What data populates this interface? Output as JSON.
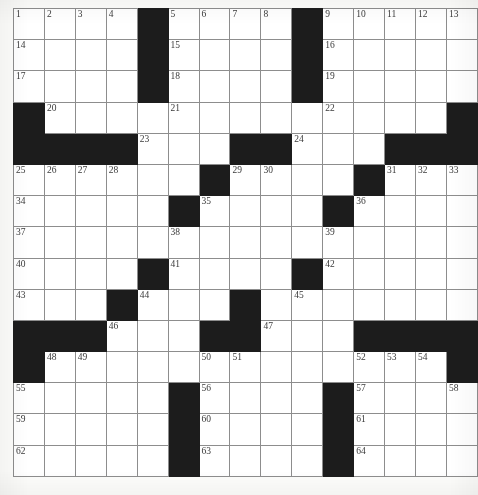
{
  "puzzle": {
    "type": "crossword-grid",
    "rows": 15,
    "columns": 15,
    "cell_size_px": 30.2,
    "colors": {
      "block": "#1c1c1c",
      "open": "#ffffff",
      "grid_line": "#8d8d8d",
      "border": "#2b2b2b",
      "number_text": "#3a3a3a"
    },
    "legend": {
      "block_symbol": "#",
      "open_symbol": "."
    },
    "grid": [
      "....#....#.....",
      "....#....#.....",
      "....#....#.....",
      "#...............",
      "####...##......",
      "......#..##..##",
      "....#.#......##",
      ".....#...#.....",
      "....#....#.....",
      "...#...#.......",
      "###...##.......",
      "#..........###.",
      "#....#....#....",
      ".....#....#....",
      ".....#....#...."
    ],
    "grid_exact": [
      [
        ".",
        ".",
        ".",
        ".",
        "#",
        ".",
        ".",
        ".",
        ".",
        "#",
        ".",
        ".",
        ".",
        ".",
        "."
      ],
      [
        ".",
        ".",
        ".",
        ".",
        "#",
        ".",
        ".",
        ".",
        ".",
        "#",
        ".",
        ".",
        ".",
        ".",
        "."
      ],
      [
        ".",
        ".",
        ".",
        ".",
        "#",
        ".",
        ".",
        ".",
        ".",
        "#",
        ".",
        ".",
        ".",
        ".",
        "."
      ],
      [
        "#",
        ".",
        ".",
        ".",
        ".",
        ".",
        ".",
        ".",
        ".",
        ".",
        ".",
        ".",
        ".",
        ".",
        "#"
      ],
      [
        "#",
        "#",
        "#",
        "#",
        ".",
        ".",
        ".",
        "#",
        "#",
        ".",
        ".",
        ".",
        "#",
        "#",
        "#"
      ],
      [
        ".",
        ".",
        ".",
        ".",
        ".",
        ".",
        "#",
        ".",
        ".",
        ".",
        ".",
        "#",
        ".",
        ".",
        "."
      ],
      [
        ".",
        ".",
        ".",
        ".",
        ".",
        "#",
        ".",
        ".",
        ".",
        ".",
        "#",
        ".",
        ".",
        ".",
        "."
      ],
      [
        ".",
        ".",
        ".",
        ".",
        ".",
        ".",
        ".",
        ".",
        ".",
        ".",
        ".",
        ".",
        ".",
        ".",
        "."
      ],
      [
        ".",
        ".",
        ".",
        ".",
        "#",
        ".",
        ".",
        ".",
        ".",
        "#",
        ".",
        ".",
        ".",
        ".",
        "."
      ],
      [
        ".",
        ".",
        ".",
        "#",
        ".",
        ".",
        ".",
        "#",
        ".",
        ".",
        ".",
        ".",
        ".",
        ".",
        "."
      ],
      [
        "#",
        "#",
        "#",
        ".",
        ".",
        ".",
        "#",
        "#",
        ".",
        ".",
        ".",
        "#",
        "#",
        "#",
        "#"
      ],
      [
        "#",
        ".",
        ".",
        ".",
        ".",
        ".",
        ".",
        ".",
        ".",
        ".",
        ".",
        ".",
        ".",
        ".",
        "#"
      ],
      [
        ".",
        ".",
        ".",
        ".",
        ".",
        "#",
        ".",
        ".",
        ".",
        ".",
        "#",
        ".",
        ".",
        ".",
        "."
      ],
      [
        ".",
        ".",
        ".",
        ".",
        ".",
        "#",
        ".",
        ".",
        ".",
        ".",
        "#",
        ".",
        ".",
        ".",
        "."
      ],
      [
        ".",
        ".",
        ".",
        ".",
        ".",
        "#",
        ".",
        ".",
        ".",
        ".",
        "#",
        ".",
        ".",
        ".",
        "."
      ]
    ],
    "numbers": [
      {
        "n": 1,
        "row": 1,
        "col": 1
      },
      {
        "n": 2,
        "row": 1,
        "col": 2
      },
      {
        "n": 3,
        "row": 1,
        "col": 3
      },
      {
        "n": 4,
        "row": 1,
        "col": 4
      },
      {
        "n": 5,
        "row": 1,
        "col": 6
      },
      {
        "n": 6,
        "row": 1,
        "col": 7
      },
      {
        "n": 7,
        "row": 1,
        "col": 8
      },
      {
        "n": 8,
        "row": 1,
        "col": 9
      },
      {
        "n": 9,
        "row": 1,
        "col": 11
      },
      {
        "n": 10,
        "row": 1,
        "col": 12
      },
      {
        "n": 11,
        "row": 1,
        "col": 13
      },
      {
        "n": 12,
        "row": 1,
        "col": 14
      },
      {
        "n": 13,
        "row": 1,
        "col": 15
      },
      {
        "n": 14,
        "row": 2,
        "col": 1
      },
      {
        "n": 15,
        "row": 2,
        "col": 6
      },
      {
        "n": 16,
        "row": 2,
        "col": 11
      },
      {
        "n": 17,
        "row": 3,
        "col": 1
      },
      {
        "n": 18,
        "row": 3,
        "col": 6
      },
      {
        "n": 19,
        "row": 3,
        "col": 11
      },
      {
        "n": 20,
        "row": 4,
        "col": 2
      },
      {
        "n": 21,
        "row": 4,
        "col": 6
      },
      {
        "n": 22,
        "row": 4,
        "col": 11
      },
      {
        "n": 23,
        "row": 5,
        "col": 5
      },
      {
        "n": 24,
        "row": 5,
        "col": 10
      },
      {
        "n": 25,
        "row": 6,
        "col": 1
      },
      {
        "n": 26,
        "row": 6,
        "col": 2
      },
      {
        "n": 27,
        "row": 6,
        "col": 3
      },
      {
        "n": 28,
        "row": 6,
        "col": 4
      },
      {
        "n": 29,
        "row": 6,
        "col": 8
      },
      {
        "n": 30,
        "row": 6,
        "col": 9
      },
      {
        "n": 31,
        "row": 6,
        "col": 13
      },
      {
        "n": 32,
        "row": 6,
        "col": 14
      },
      {
        "n": 33,
        "row": 6,
        "col": 15
      },
      {
        "n": 34,
        "row": 7,
        "col": 1
      },
      {
        "n": 35,
        "row": 7,
        "col": 7
      },
      {
        "n": 36,
        "row": 7,
        "col": 12
      },
      {
        "n": 37,
        "row": 8,
        "col": 1
      },
      {
        "n": 38,
        "row": 8,
        "col": 6
      },
      {
        "n": 39,
        "row": 8,
        "col": 11
      },
      {
        "n": 40,
        "row": 9,
        "col": 1
      },
      {
        "n": 41,
        "row": 9,
        "col": 6
      },
      {
        "n": 42,
        "row": 9,
        "col": 11
      },
      {
        "n": 43,
        "row": 10,
        "col": 1
      },
      {
        "n": 44,
        "row": 10,
        "col": 5
      },
      {
        "n": 45,
        "row": 10,
        "col": 10
      },
      {
        "n": 46,
        "row": 11,
        "col": 4
      },
      {
        "n": 47,
        "row": 11,
        "col": 9
      },
      {
        "n": 48,
        "row": 12,
        "col": 2
      },
      {
        "n": 49,
        "row": 12,
        "col": 3
      },
      {
        "n": 50,
        "row": 12,
        "col": 7
      },
      {
        "n": 51,
        "row": 12,
        "col": 8
      },
      {
        "n": 52,
        "row": 12,
        "col": 12
      },
      {
        "n": 53,
        "row": 12,
        "col": 13
      },
      {
        "n": 54,
        "row": 12,
        "col": 14
      },
      {
        "n": 55,
        "row": 13,
        "col": 1
      },
      {
        "n": 56,
        "row": 13,
        "col": 7
      },
      {
        "n": 57,
        "row": 13,
        "col": 12
      },
      {
        "n": 58,
        "row": 13,
        "col": 15
      },
      {
        "n": 59,
        "row": 14,
        "col": 1
      },
      {
        "n": 60,
        "row": 14,
        "col": 7
      },
      {
        "n": 61,
        "row": 14,
        "col": 12
      },
      {
        "n": 62,
        "row": 15,
        "col": 1
      },
      {
        "n": 63,
        "row": 15,
        "col": 7
      },
      {
        "n": 64,
        "row": 15,
        "col": 12
      }
    ],
    "entries": []
  }
}
